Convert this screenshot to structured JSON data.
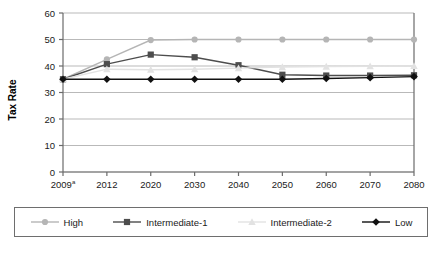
{
  "chart_data": {
    "type": "line",
    "title": "",
    "xlabel": "",
    "ylabel": "Tax Rate",
    "ylim": [
      0,
      60
    ],
    "ytick_values": [
      0,
      10,
      20,
      30,
      40,
      50,
      60
    ],
    "ytick_labels": [
      "0",
      "10",
      "20",
      "30",
      "40",
      "50",
      "60"
    ],
    "categories": [
      "2009",
      "2012",
      "2020",
      "2030",
      "2040",
      "2050",
      "2060",
      "2070",
      "2080"
    ],
    "xtick_labels": [
      "2009",
      "2012",
      "2020",
      "2030",
      "2040",
      "2050",
      "2060",
      "2070",
      "2080"
    ],
    "xtick_superscripts": [
      "a",
      "",
      "",
      "",
      "",
      "",
      "",
      "",
      ""
    ],
    "grid": true,
    "legend_position": "bottom",
    "series": [
      {
        "name": "High",
        "color": "#b5b5b5",
        "marker": "circle",
        "x": [
          "2009",
          "2012",
          "2020",
          "2030",
          "2040",
          "2050",
          "2060",
          "2070",
          "2080"
        ],
        "values": [
          35.0,
          42.5,
          49.8,
          50.0,
          50.0,
          50.0,
          50.0,
          50.0,
          50.0
        ]
      },
      {
        "name": "Intermediate-1",
        "color": "#4d4d4d",
        "marker": "square",
        "x": [
          "2009",
          "2012",
          "2020",
          "2030",
          "2040",
          "2050",
          "2060",
          "2070",
          "2080"
        ],
        "values": [
          35.0,
          40.7,
          44.3,
          43.3,
          40.3,
          36.7,
          36.4,
          36.4,
          36.5
        ]
      },
      {
        "name": "Intermediate-2",
        "color": "#e2e2e2",
        "marker": "triangle",
        "x": [
          "2009",
          "2012",
          "2020",
          "2030",
          "2040",
          "2050",
          "2060",
          "2070",
          "2080"
        ],
        "values": [
          35.0,
          38.8,
          38.6,
          38.8,
          39.2,
          39.6,
          39.8,
          39.9,
          40.0
        ]
      },
      {
        "name": "Low",
        "color": "#111111",
        "marker": "diamond",
        "x": [
          "2009",
          "2012",
          "2020",
          "2030",
          "2040",
          "2050",
          "2060",
          "2070",
          "2080"
        ],
        "values": [
          35.0,
          35.0,
          35.0,
          35.0,
          35.0,
          35.0,
          35.3,
          35.6,
          36.0
        ]
      }
    ]
  },
  "axis": {
    "y_title": "Tax Rate"
  },
  "legend": {
    "items": [
      {
        "label": "High",
        "color": "#b5b5b5",
        "marker": "circle"
      },
      {
        "label": "Intermediate-1",
        "color": "#4d4d4d",
        "marker": "square"
      },
      {
        "label": "Intermediate-2",
        "color": "#e2e2e2",
        "marker": "triangle"
      },
      {
        "label": "Low",
        "color": "#111111",
        "marker": "diamond"
      }
    ]
  }
}
